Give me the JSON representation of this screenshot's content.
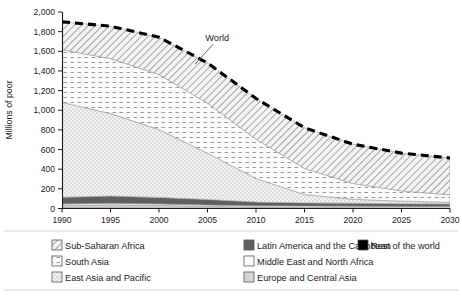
{
  "chart_data": {
    "type": "area",
    "stacked": true,
    "title": "",
    "xlabel": "",
    "ylabel": "Millions of poor",
    "xlim": [
      1990,
      2030
    ],
    "ylim": [
      0,
      2000
    ],
    "ytick_step": 200,
    "grid": false,
    "legend_position": "bottom",
    "x": [
      1990,
      1995,
      2000,
      2005,
      2010,
      2015,
      2020,
      2025,
      2030
    ],
    "xtick_labels": [
      "1990",
      "1995",
      "2000",
      "2005",
      "2010",
      "2015",
      "2020",
      "2025",
      "2030"
    ],
    "ytick_labels": [
      "0",
      "200",
      "400",
      "600",
      "800",
      "1,000",
      "1,200",
      "1,400",
      "1,600",
      "1,800",
      "2,000"
    ],
    "series": [
      {
        "name": "Rest of the world",
        "color": "#000000",
        "pattern": "solid",
        "values": [
          8,
          7,
          6,
          5,
          4,
          3,
          3,
          2,
          2
        ]
      },
      {
        "name": "Europe and Central Asia",
        "color": "#d0d0d0",
        "pattern": "solid",
        "values": [
          22,
          30,
          26,
          16,
          10,
          8,
          7,
          6,
          6
        ]
      },
      {
        "name": "Middle East and North Africa",
        "color": "#ffffff",
        "pattern": "solid",
        "values": [
          16,
          16,
          15,
          14,
          13,
          14,
          14,
          13,
          12
        ]
      },
      {
        "name": "Latin America and the Caribbean",
        "color": "#606060",
        "pattern": "solid",
        "values": [
          68,
          73,
          66,
          57,
          38,
          32,
          30,
          28,
          26
        ]
      },
      {
        "name": "East Asia and Pacific",
        "color": "#f0f0f0",
        "pattern": "dots-fine",
        "values": [
          966,
          840,
          690,
          470,
          240,
          85,
          40,
          25,
          18
        ]
      },
      {
        "name": "South Asia",
        "color": "#fafafa",
        "pattern": "dash-rows",
        "values": [
          536,
          560,
          560,
          510,
          400,
          265,
          160,
          105,
          75
        ]
      },
      {
        "name": "Sub-Saharan Africa",
        "color": "#ededed",
        "pattern": "diag-hatch",
        "values": [
          284,
          330,
          380,
          410,
          415,
          415,
          400,
          385,
          375
        ]
      }
    ],
    "total_line": {
      "name": "World",
      "style": "dashed",
      "color": "#000000",
      "values": [
        1900,
        1856,
        1743,
        1482,
        1120,
        822,
        654,
        564,
        514
      ]
    },
    "annotations": [
      {
        "text": "World",
        "x": 2006.0,
        "y": 1480
      }
    ]
  },
  "legend": {
    "columns": [
      [
        {
          "label": "Sub-Saharan Africa",
          "swatch": "diag-hatch"
        },
        {
          "label": "South Asia",
          "swatch": "dash-rows"
        },
        {
          "label": "East Asia and Pacific",
          "swatch": "dots-fine"
        }
      ],
      [
        {
          "label": "Latin America and the Caribbean",
          "swatch": "solid-dark"
        },
        {
          "label": "Middle East and North Africa",
          "swatch": "solid-white"
        },
        {
          "label": "Europe and Central Asia",
          "swatch": "solid-light"
        }
      ],
      [
        {
          "label": "Rest of the world",
          "swatch": "solid-black"
        }
      ]
    ]
  }
}
